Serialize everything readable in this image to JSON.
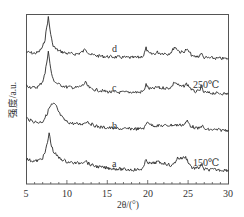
{
  "chart_data": {
    "type": "line",
    "title": "",
    "xlabel": "2θ/(°)",
    "ylabel": "强度/a.u.",
    "xlim": [
      5,
      30
    ],
    "xticks": [
      5,
      10,
      15,
      20,
      25,
      30
    ],
    "grid": false,
    "legend": "none (inline labels)",
    "annotations": [
      {
        "text": "d",
        "x": 15.8,
        "series": "d"
      },
      {
        "text": "c",
        "x": 15.8,
        "series": "c"
      },
      {
        "text": "250℃",
        "x": 27.8,
        "series": "c"
      },
      {
        "text": "b",
        "x": 15.8,
        "series": "b"
      },
      {
        "text": "a",
        "x": 15.8,
        "series": "a"
      },
      {
        "text": "150℃",
        "x": 27.8,
        "series": "a"
      }
    ],
    "series": [
      {
        "name": "d",
        "offset": 3,
        "peaks_2theta": [
          7.6,
          12.3,
          19.8,
          21.2,
          23.3,
          24.8,
          26.6
        ],
        "x": [
          5,
          5.5,
          6,
          6.5,
          7,
          7.3,
          7.5,
          7.7,
          7.9,
          8.2,
          8.6,
          9,
          9.5,
          10,
          10.5,
          11,
          11.5,
          12,
          12.3,
          12.6,
          13,
          14,
          15,
          16,
          17,
          18,
          19,
          19.5,
          19.8,
          20.1,
          20.5,
          21,
          21.2,
          21.6,
          22,
          22.5,
          23,
          23.3,
          23.7,
          24,
          24.4,
          24.8,
          25.2,
          25.6,
          26,
          26.4,
          26.6,
          26.9,
          27.5,
          28,
          28.5,
          29,
          29.5,
          30
        ],
        "y": [
          0.3,
          0.28,
          0.26,
          0.3,
          0.45,
          0.7,
          1.05,
          1.35,
          1.0,
          0.55,
          0.4,
          0.34,
          0.3,
          0.26,
          0.25,
          0.24,
          0.26,
          0.32,
          0.4,
          0.3,
          0.22,
          0.18,
          0.16,
          0.15,
          0.14,
          0.13,
          0.14,
          0.2,
          0.42,
          0.26,
          0.24,
          0.26,
          0.3,
          0.26,
          0.27,
          0.24,
          0.32,
          0.46,
          0.38,
          0.3,
          0.3,
          0.38,
          0.28,
          0.16,
          0.16,
          0.18,
          0.28,
          0.14,
          0.12,
          0.12,
          0.11,
          0.11,
          0.1,
          0.1
        ]
      },
      {
        "name": "c",
        "offset": 2,
        "peaks_2theta": [
          7.6,
          12.3,
          19.8,
          21.2,
          23.3,
          24.8,
          26.6
        ],
        "x": [
          5,
          5.5,
          6,
          6.5,
          7,
          7.3,
          7.5,
          7.7,
          7.9,
          8.2,
          8.6,
          9,
          9.5,
          10,
          10.5,
          11,
          11.5,
          12,
          12.3,
          12.6,
          13,
          14,
          15,
          16,
          17,
          18,
          19,
          19.5,
          19.8,
          20.1,
          20.5,
          21,
          21.2,
          21.6,
          22,
          22.5,
          23,
          23.3,
          23.7,
          24,
          24.4,
          24.8,
          25.2,
          25.6,
          26,
          26.4,
          26.6,
          26.9,
          27.5,
          28,
          28.5,
          29,
          29.5,
          30
        ],
        "y": [
          0.35,
          0.3,
          0.28,
          0.32,
          0.48,
          0.72,
          1.05,
          1.4,
          1.0,
          0.58,
          0.44,
          0.38,
          0.34,
          0.3,
          0.3,
          0.28,
          0.3,
          0.36,
          0.44,
          0.32,
          0.24,
          0.2,
          0.16,
          0.14,
          0.14,
          0.15,
          0.14,
          0.18,
          0.38,
          0.26,
          0.24,
          0.28,
          0.3,
          0.26,
          0.28,
          0.26,
          0.32,
          0.46,
          0.38,
          0.32,
          0.32,
          0.4,
          0.3,
          0.18,
          0.16,
          0.18,
          0.32,
          0.15,
          0.12,
          0.12,
          0.11,
          0.11,
          0.1,
          0.1
        ]
      },
      {
        "name": "b",
        "offset": 1,
        "peaks_2theta": [
          8.3,
          12.5,
          20.0,
          24.9,
          26.7
        ],
        "x": [
          5,
          5.5,
          6,
          6.5,
          7,
          7.5,
          7.8,
          8.1,
          8.4,
          8.7,
          9,
          9.5,
          10,
          10.5,
          11,
          11.5,
          12,
          12.5,
          12.9,
          13.5,
          14,
          15,
          16,
          17,
          18,
          19,
          19.6,
          20,
          20.4,
          21,
          22,
          23,
          24,
          24.5,
          24.9,
          25.3,
          26,
          26.4,
          26.7,
          27,
          27.5,
          28,
          29,
          30
        ],
        "y": [
          0.45,
          0.38,
          0.34,
          0.32,
          0.35,
          0.55,
          0.75,
          0.85,
          0.88,
          0.8,
          0.62,
          0.44,
          0.34,
          0.3,
          0.28,
          0.27,
          0.28,
          0.36,
          0.28,
          0.22,
          0.18,
          0.16,
          0.14,
          0.12,
          0.13,
          0.12,
          0.16,
          0.36,
          0.24,
          0.22,
          0.22,
          0.24,
          0.24,
          0.26,
          0.36,
          0.22,
          0.14,
          0.14,
          0.24,
          0.12,
          0.1,
          0.1,
          0.09,
          0.09
        ]
      },
      {
        "name": "a",
        "offset": 0,
        "peaks_2theta": [
          7.8,
          12.3,
          19.8,
          21.2,
          23.7,
          24.7,
          26.6
        ],
        "x": [
          5,
          5.5,
          6,
          6.5,
          7,
          7.3,
          7.6,
          7.8,
          8.0,
          8.3,
          8.7,
          9,
          9.5,
          10,
          10.5,
          11,
          11.5,
          12,
          12.3,
          12.6,
          13,
          14,
          15,
          16,
          17,
          18,
          19,
          19.5,
          19.8,
          20.1,
          20.5,
          21,
          21.2,
          21.6,
          22,
          22.5,
          23,
          23.3,
          23.7,
          24,
          24.4,
          24.7,
          25.1,
          25.5,
          26,
          26.4,
          26.6,
          26.9,
          27.5,
          28,
          28.5,
          29,
          29.5,
          30
        ],
        "y": [
          0.42,
          0.38,
          0.36,
          0.38,
          0.46,
          0.62,
          0.92,
          1.22,
          0.92,
          0.66,
          0.54,
          0.46,
          0.4,
          0.34,
          0.32,
          0.3,
          0.3,
          0.34,
          0.38,
          0.3,
          0.24,
          0.18,
          0.15,
          0.13,
          0.11,
          0.1,
          0.1,
          0.16,
          0.42,
          0.3,
          0.28,
          0.32,
          0.34,
          0.3,
          0.3,
          0.26,
          0.22,
          0.3,
          0.46,
          0.44,
          0.46,
          0.48,
          0.3,
          0.16,
          0.14,
          0.16,
          0.28,
          0.12,
          0.1,
          0.1,
          0.1,
          0.09,
          0.09,
          0.08
        ]
      }
    ]
  },
  "labels": {
    "xlabel": "2θ/(°)",
    "ylabel": "强度/a.u.",
    "d": "d",
    "c": "c",
    "b": "b",
    "a": "a",
    "temp_250": "250℃",
    "temp_150": "150℃",
    "xticks": [
      "5",
      "10",
      "15",
      "20",
      "25",
      "30"
    ]
  }
}
